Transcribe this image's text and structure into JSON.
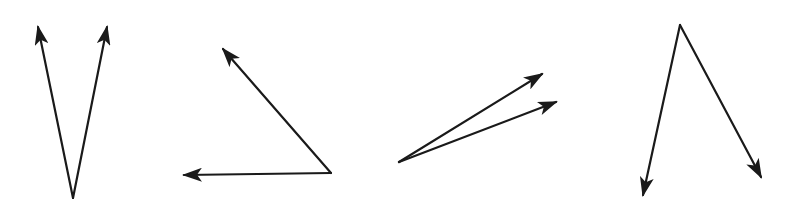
{
  "figure": {
    "stroke_color": "#1a1a1a",
    "background": "#ffffff",
    "angles": [
      {
        "id": "angle-1",
        "vertex": [
          73,
          198
        ],
        "ray_tips": [
          [
            38,
            27
          ],
          [
            107,
            27
          ]
        ],
        "type": "acute"
      },
      {
        "id": "angle-2",
        "vertex": [
          331,
          173
        ],
        "ray_tips": [
          [
            223,
            49
          ],
          [
            184,
            175
          ]
        ],
        "type": "acute"
      },
      {
        "id": "angle-3",
        "vertex": [
          399,
          162
        ],
        "ray_tips": [
          [
            542,
            74
          ],
          [
            556,
            102
          ]
        ],
        "type": "acute"
      },
      {
        "id": "angle-4",
        "vertex": [
          680,
          25
        ],
        "ray_tips": [
          [
            643,
            195
          ],
          [
            761,
            177
          ]
        ],
        "type": "acute"
      }
    ]
  }
}
